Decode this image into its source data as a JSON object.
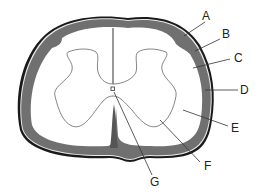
{
  "diagram": {
    "labels": [
      {
        "id": "A",
        "text": "A",
        "x": 208,
        "y": 20
      },
      {
        "id": "B",
        "text": "B",
        "x": 224,
        "y": 38
      },
      {
        "id": "C",
        "text": "C",
        "x": 235,
        "y": 62
      },
      {
        "id": "D",
        "text": "D",
        "x": 240,
        "y": 93
      },
      {
        "id": "E",
        "text": "E",
        "x": 231,
        "y": 131
      },
      {
        "id": "F",
        "text": "F",
        "x": 204,
        "y": 170
      },
      {
        "id": "G",
        "text": "G",
        "x": 152,
        "y": 186
      }
    ],
    "colors": {
      "outline": "#1a1a1a",
      "membrane": "#6e6e6e",
      "white_matter": "#ffffff",
      "grey_matter_outline": "#666666",
      "leader_line": "#333333"
    }
  }
}
